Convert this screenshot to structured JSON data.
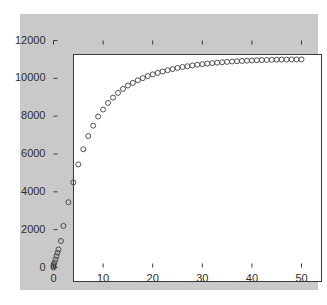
{
  "chart_data": {
    "type": "scatter",
    "title": "",
    "xlabel": "",
    "ylabel": "",
    "xlim": [
      0,
      50
    ],
    "ylim": [
      0,
      12000
    ],
    "grid": false,
    "legend": null,
    "marker": {
      "shape": "circle",
      "filled": false,
      "edge_color": "#404040",
      "size_px": 5
    },
    "xticks": [
      0,
      10,
      20,
      30,
      40,
      50
    ],
    "xtick_labels": [
      "0",
      "10",
      "20",
      "30",
      "40",
      "50"
    ],
    "yticks": [
      0,
      2000,
      4000,
      6000,
      8000,
      10000,
      12000
    ],
    "ytick_labels": [
      "0",
      "2000",
      "4000",
      "6000",
      "8000",
      "10000",
      "12000"
    ],
    "series": [
      {
        "name": "data",
        "x": [
          0,
          0,
          0,
          0.2,
          0.4,
          0.6,
          0.8,
          1,
          1.5,
          2,
          3,
          4,
          5,
          6,
          7,
          8,
          9,
          10,
          11,
          12,
          13,
          14,
          15,
          16,
          17,
          18,
          19,
          20,
          21,
          22,
          23,
          24,
          25,
          26,
          27,
          28,
          29,
          30,
          31,
          32,
          33,
          34,
          35,
          36,
          37,
          38,
          39,
          40,
          41,
          42,
          43,
          44,
          45,
          46,
          47,
          48,
          49,
          50
        ],
        "y": [
          0,
          60,
          140,
          260,
          420,
          600,
          780,
          950,
          1400,
          2200,
          3450,
          4500,
          5450,
          6250,
          6950,
          7500,
          7980,
          8350,
          8700,
          8980,
          9230,
          9440,
          9620,
          9760,
          9900,
          10010,
          10120,
          10210,
          10290,
          10360,
          10430,
          10490,
          10550,
          10600,
          10640,
          10680,
          10720,
          10750,
          10780,
          10805,
          10830,
          10850,
          10870,
          10890,
          10905,
          10920,
          10935,
          10945,
          10955,
          10965,
          10973,
          10980,
          10986,
          10991,
          10995,
          10998,
          11000,
          11002
        ]
      }
    ]
  },
  "figure": {
    "background_color": "#c9c9c9",
    "axes_background_color": "#ffffff",
    "axes_edge_color": "#3a3a3a",
    "tick_label_color": "#2e2e2e"
  }
}
